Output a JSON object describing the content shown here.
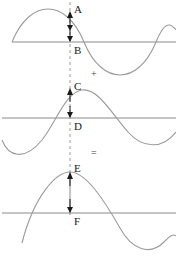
{
  "figure": {
    "background": "#ffffff",
    "curve_color": "#9b9b9b",
    "axis_color": "#8a8a8a",
    "marker_color": "#1a1a1a",
    "width": 176,
    "height": 265
  },
  "operators": [
    {
      "name": "plus",
      "symbol": "+",
      "x": 91,
      "y": 69
    },
    {
      "name": "equals",
      "symbol": "=",
      "x": 91,
      "y": 148
    }
  ],
  "reference_line": {
    "x": 70,
    "style": "dashed",
    "top": 0,
    "bottom": 215,
    "color": "#9a9a9a"
  },
  "panels": [
    {
      "name": "panel-top",
      "index": 1,
      "axis_y": 42,
      "amplitude": 30,
      "wavelength": 144,
      "phase_x": 12,
      "x_start": 12,
      "x_end": 176,
      "labels": [
        {
          "name": "label-a",
          "text": "A",
          "x": 74,
          "y": 5
        },
        {
          "name": "label-b",
          "text": "B",
          "x": 74,
          "y": 46
        }
      ],
      "markers": [
        {
          "name": "arrow-a",
          "from_y": 12,
          "to_y": 26,
          "direction": "up"
        },
        {
          "name": "arrow-b",
          "from_y": 30,
          "to_y": 42,
          "direction": "down"
        }
      ]
    },
    {
      "name": "panel-middle",
      "index": 2,
      "axis_y": 118,
      "amplitude": 30,
      "wavelength": 144,
      "phase_x": -24,
      "x_start": 0,
      "x_end": 176,
      "labels": [
        {
          "name": "label-c",
          "text": "C",
          "x": 74,
          "y": 82
        },
        {
          "name": "label-d",
          "text": "D",
          "x": 74,
          "y": 122
        }
      ],
      "markers": [
        {
          "name": "arrow-c",
          "from_y": 88,
          "to_y": 102,
          "direction": "up"
        },
        {
          "name": "arrow-d",
          "from_y": 106,
          "to_y": 118,
          "direction": "down"
        }
      ]
    },
    {
      "name": "panel-bottom",
      "index": 3,
      "axis_y": 213,
      "amplitude": 38,
      "wavelength": 144,
      "phase_x": -6,
      "x_start": 0,
      "x_end": 176,
      "labels": [
        {
          "name": "label-e",
          "text": "E",
          "x": 74,
          "y": 164
        },
        {
          "name": "label-f",
          "text": "F",
          "x": 74,
          "y": 217
        }
      ],
      "markers": [
        {
          "name": "arrow-e",
          "from_y": 172,
          "to_y": 186,
          "direction": "up"
        },
        {
          "name": "arrow-f",
          "from_y": 199,
          "to_y": 213,
          "direction": "down"
        }
      ]
    }
  ]
}
